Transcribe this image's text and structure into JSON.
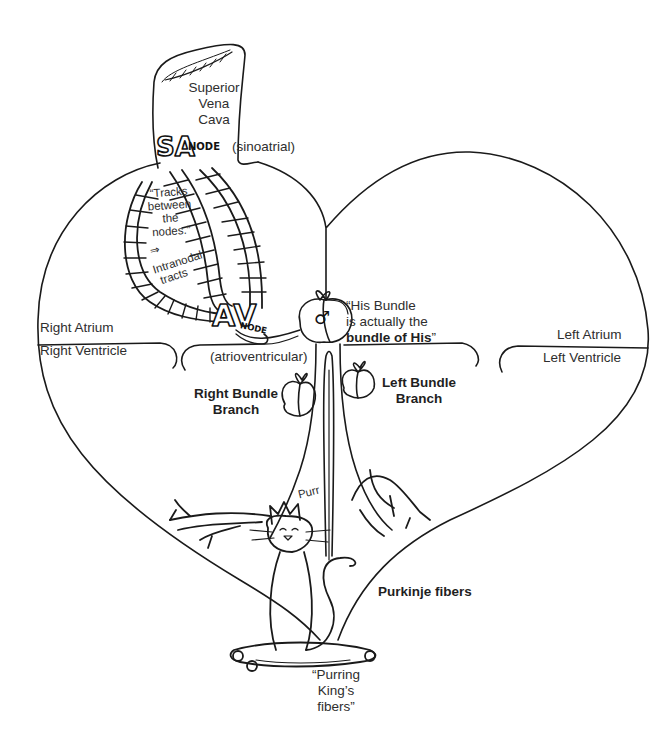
{
  "diagram": {
    "type": "illustration",
    "colors": {
      "ink": "#1a1a1a",
      "text": "#2e2e2e",
      "background": "#ffffff"
    }
  },
  "labels": {
    "svc": [
      "Superior",
      "Vena",
      "Cava"
    ],
    "sa_node": {
      "glyph": "SA",
      "word": "NODE",
      "note": "(sinoatrial)"
    },
    "tracks": [
      "“Tracks",
      "between",
      "the",
      "nodes.”",
      "⇒",
      "Intranodal",
      "tracts"
    ],
    "av_node": {
      "glyph": "AV",
      "word": "NODE",
      "note": "(atrioventricular)"
    },
    "his_bundle": {
      "line1": "“His Bundle",
      "line2": "is actually the",
      "line3_bold": "bundle of His",
      "line3_end": "”",
      "symbol": "♂"
    },
    "right_atrium": "Right Atrium",
    "right_ventricle": "Right Ventricle",
    "left_atrium": "Left Atrium",
    "left_ventricle": "Left Ventricle",
    "right_bundle_branch": [
      "Right Bundle",
      "Branch"
    ],
    "left_bundle_branch": [
      "Left Bundle",
      "Branch"
    ],
    "purr": "Purr",
    "purkinje_fibers": "Purkinje fibers",
    "purring_kings": [
      "“Purring",
      "King’s",
      "fibers”"
    ]
  }
}
